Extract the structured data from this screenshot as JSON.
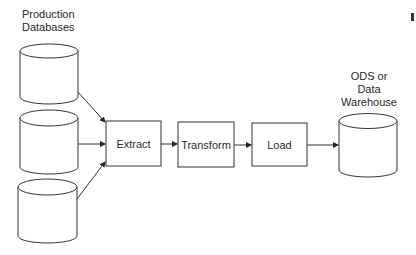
{
  "diagram": {
    "type": "etl-flow",
    "source_group": {
      "label_lines": [
        "Production",
        "Databases"
      ],
      "databases": [
        {
          "id": "db1",
          "shape": "cylinder"
        },
        {
          "id": "db2",
          "shape": "cylinder"
        },
        {
          "id": "db3",
          "shape": "cylinder"
        }
      ]
    },
    "steps": [
      {
        "id": "extract",
        "label": "Extract"
      },
      {
        "id": "transform",
        "label": "Transform"
      },
      {
        "id": "load",
        "label": "Load"
      }
    ],
    "target": {
      "label_lines": [
        "ODS or",
        "Data",
        "Warehouse"
      ],
      "shape": "cylinder"
    },
    "edges": [
      {
        "from": "db1",
        "to": "extract"
      },
      {
        "from": "db2",
        "to": "extract"
      },
      {
        "from": "db3",
        "to": "extract"
      },
      {
        "from": "extract",
        "to": "transform"
      },
      {
        "from": "transform",
        "to": "load"
      },
      {
        "from": "load",
        "to": "target"
      }
    ],
    "colors": {
      "stroke": "#333333",
      "background": "#ffffff",
      "text": "#2a2a2a"
    }
  }
}
